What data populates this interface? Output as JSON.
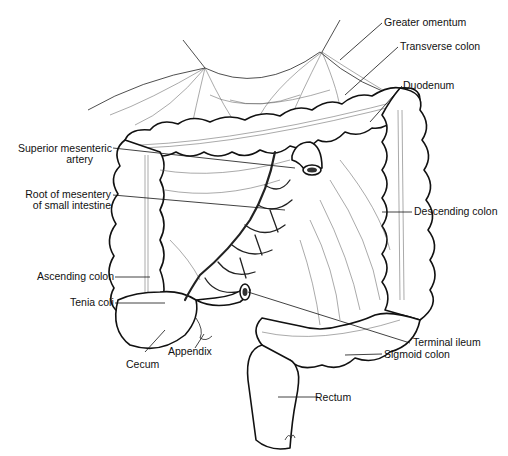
{
  "figure": {
    "style": "black-and-white line illustration",
    "background": "#ffffff",
    "ink": "#111111"
  },
  "labels": {
    "greater_omentum": "Greater omentum",
    "transverse_colon": "Transverse colon",
    "duodenum": "Duodenum",
    "superior_mesenteric_artery_1": "Superior mesenteric",
    "superior_mesenteric_artery_2": "artery",
    "root_of_mesentery_1": "Root of mesentery",
    "root_of_mesentery_2": "of small intestine",
    "descending_colon": "Descending colon",
    "ascending_colon": "Ascending colon",
    "tenia_coli": "Tenia coli",
    "appendix": "Appendix",
    "cecum": "Cecum",
    "terminal_ileum": "Terminal ileum",
    "sigmoid_colon": "Sigmoid colon",
    "rectum": "Rectum"
  }
}
